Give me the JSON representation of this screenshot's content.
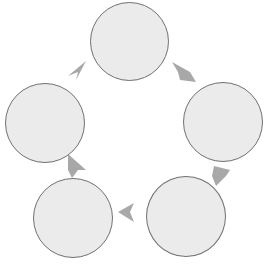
{
  "diagram": {
    "type": "cycle",
    "direction": "clockwise",
    "colors": {
      "node_fill": "#ebebeb",
      "node_border": "#707070",
      "arrow": "#a8a8a8"
    },
    "nodes": [
      {
        "id": "top",
        "label": ""
      },
      {
        "id": "right",
        "label": ""
      },
      {
        "id": "bottom-right",
        "label": ""
      },
      {
        "id": "bottom-left",
        "label": ""
      },
      {
        "id": "left",
        "label": ""
      }
    ],
    "edges": [
      {
        "from": "top",
        "to": "right"
      },
      {
        "from": "right",
        "to": "bottom-right"
      },
      {
        "from": "bottom-right",
        "to": "bottom-left"
      },
      {
        "from": "bottom-left",
        "to": "left"
      },
      {
        "from": "left",
        "to": "top"
      }
    ]
  }
}
